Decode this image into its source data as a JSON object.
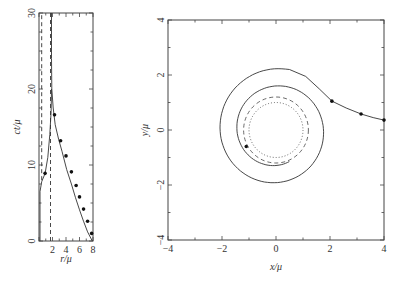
{
  "chart_data": [
    {
      "type": "line",
      "panel": "left",
      "xlabel": "r/μ",
      "ylabel": "ct/μ",
      "xlim": [
        0,
        8
      ],
      "ylim": [
        0,
        30
      ],
      "xticks": [
        "2",
        "4",
        "6",
        "8"
      ],
      "yticks": [
        "0",
        "10",
        "20",
        "30"
      ],
      "series": [
        {
          "name": "infalling trajectory (outer)",
          "style": "solid",
          "markers": true,
          "points": [
            [
              7.9,
              0
            ],
            [
              7.2,
              1.2
            ],
            [
              6.6,
              2.6
            ],
            [
              6.0,
              4.1
            ],
            [
              5.4,
              5.7
            ],
            [
              4.8,
              7.5
            ],
            [
              4.1,
              9.4
            ],
            [
              3.4,
              11.8
            ],
            [
              2.9,
              13.4
            ],
            [
              2.4,
              15.3
            ],
            [
              2.1,
              17.5
            ],
            [
              1.9,
              20
            ],
            [
              1.85,
              24
            ],
            [
              1.85,
              30
            ]
          ],
          "marker_points": [
            [
              7.8,
              1.0
            ],
            [
              7.2,
              2.6
            ],
            [
              6.6,
              4.2
            ],
            [
              6.0,
              5.8
            ],
            [
              5.5,
              7.3
            ],
            [
              4.8,
              9.1
            ],
            [
              4.0,
              11.2
            ],
            [
              3.2,
              13.2
            ],
            [
              2.3,
              16.6
            ]
          ]
        },
        {
          "name": "inner trajectory",
          "style": "solid",
          "markers": true,
          "points": [
            [
              0.15,
              0
            ],
            [
              0.15,
              6.5
            ],
            [
              0.4,
              7.8
            ],
            [
              0.9,
              8.9
            ],
            [
              1.3,
              11
            ],
            [
              1.6,
              14
            ],
            [
              1.8,
              17
            ],
            [
              1.85,
              20
            ]
          ],
          "marker_points": [
            [
              0.9,
              8.9
            ]
          ]
        },
        {
          "name": "r = 1.7 (dashed)",
          "style": "dashed",
          "points": [
            [
              1.7,
              0
            ],
            [
              1.7,
              30
            ]
          ]
        },
        {
          "name": "r = 0.4 (dashed)",
          "style": "dashed",
          "points": [
            [
              0.4,
              8
            ],
            [
              0.4,
              30
            ]
          ]
        }
      ]
    },
    {
      "type": "line",
      "panel": "right",
      "xlabel": "x/μ",
      "ylabel": "y/μ",
      "xlim": [
        -4,
        4
      ],
      "ylim": [
        -4,
        4
      ],
      "xticks": [
        "-4",
        "-2",
        "0",
        "2",
        "4"
      ],
      "yticks": [
        "-4",
        "-2",
        "0",
        "2",
        "4"
      ],
      "series": [
        {
          "name": "orbit",
          "style": "solid",
          "markers": true,
          "marker_points": [
            [
              4.0,
              0.36
            ],
            [
              3.15,
              0.58
            ],
            [
              2.07,
              1.05
            ],
            [
              -1.1,
              -0.6
            ]
          ]
        },
        {
          "name": "dashed circle",
          "style": "dashed",
          "radius": 1.2
        },
        {
          "name": "dotted circle",
          "style": "dotted",
          "radius": 1.0
        }
      ]
    }
  ]
}
